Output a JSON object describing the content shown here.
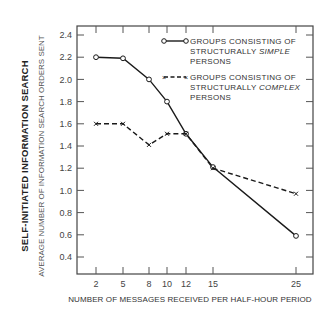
{
  "chart_data": {
    "type": "line",
    "title": "",
    "ylabel": "SELF-INITIATED INFORMATION SEARCH",
    "ylabel_sub": "AVERAGE NUMBER OF INFORMATION SEARCH ORDERS SENT",
    "xlabel": "NUMBER OF MESSAGES RECEIVED PER HALF-HOUR PERIOD",
    "x": [
      2,
      5,
      8,
      10,
      12,
      15,
      25
    ],
    "x_tick_labels": [
      "2",
      "5",
      "8",
      "10",
      "12",
      "15",
      "25"
    ],
    "y_ticks": [
      0.4,
      0.6,
      0.8,
      1.0,
      1.2,
      1.4,
      1.6,
      1.8,
      2.0,
      2.2,
      2.4
    ],
    "y_tick_labels": [
      "0.4",
      "0.6",
      "0.8",
      "1.0",
      "1.2",
      "1.4",
      "1.6",
      "1.8",
      "2.0",
      "2.2",
      "2.4"
    ],
    "ylim": [
      0.25,
      2.5
    ],
    "grid": false,
    "legend_position": "upper right (inside)",
    "series": [
      {
        "name": "GROUPS CONSISTING OF STRUCTURALLY SIMPLE PERSONS",
        "legend_lines": [
          "GROUPS CONSISTING OF",
          "STRUCTURALLY ",
          "SIMPLE",
          "PERSONS"
        ],
        "marker": "circle",
        "line_style": "solid",
        "values": [
          2.2,
          2.19,
          2.0,
          1.8,
          1.51,
          1.21,
          0.59
        ]
      },
      {
        "name": "GROUPS CONSISTING OF STRUCTURALLY COMPLEX PERSONS",
        "legend_lines": [
          "GROUPS CONSISTING OF",
          "STRUCTURALLY ",
          "COMPLEX",
          "PERSONS"
        ],
        "marker": "x",
        "line_style": "dashed",
        "values": [
          1.6,
          1.6,
          1.41,
          1.51,
          1.51,
          1.2,
          0.97
        ]
      }
    ],
    "colors": {
      "line": "#1a1a1a",
      "axis": "#444444",
      "text": "#333333"
    }
  }
}
